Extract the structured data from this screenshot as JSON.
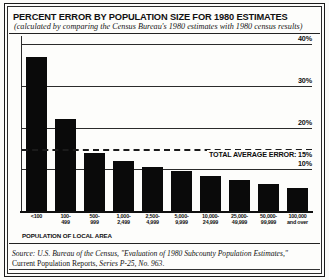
{
  "chart_data": {
    "type": "bar",
    "title": "PERCENT ERROR BY POPULATION SIZE FOR 1980 ESTIMATES",
    "subtitle": "(calculated by comparing the Census Bureau's 1980 estimates with 1980 census results)",
    "xlabel": "POPULATION OF LOCAL AREA",
    "ylabel": "",
    "ylim": [
      0,
      42
    ],
    "grid": true,
    "legend": "none",
    "categories": [
      "<100",
      "100-499",
      "500-999",
      "1,000-2,499",
      "2,500-4,999",
      "5,000-9,999",
      "10,000-24,999",
      "25,000-49,999",
      "50,000-99,999",
      "100,000 and over"
    ],
    "category_lines": [
      [
        "<100"
      ],
      [
        "100-",
        "499"
      ],
      [
        "500-",
        "999"
      ],
      [
        "1,000-",
        "2,499"
      ],
      [
        "2,500-",
        "4,999"
      ],
      [
        "5,000-",
        "9,999"
      ],
      [
        "10,000-",
        "24,999"
      ],
      [
        "25,000-",
        "49,999"
      ],
      [
        "50,000-",
        "99,999"
      ],
      [
        "100,000",
        "and over"
      ]
    ],
    "values": [
      37,
      22,
      14,
      12,
      10.5,
      9.5,
      8.5,
      7.5,
      6.5,
      5.5
    ],
    "yticks": [
      10,
      20,
      30,
      40
    ],
    "ytick_labels": [
      "10%",
      "20%",
      "30%",
      "40%"
    ],
    "annotation": {
      "label": "TOTAL AVERAGE ERROR: 15%",
      "value": 15,
      "style": "dashed"
    },
    "bar_color": "#0a0a0a"
  },
  "source": {
    "line1": "Source: U.S. Bureau of the Census, \"Evaluation of 1980 Subcounty Population Estimates,\"",
    "line2_plain_a": "Current Population Reports, ",
    "line2_italic": "Series P-25, No. 963",
    "line2_plain_b": "."
  }
}
